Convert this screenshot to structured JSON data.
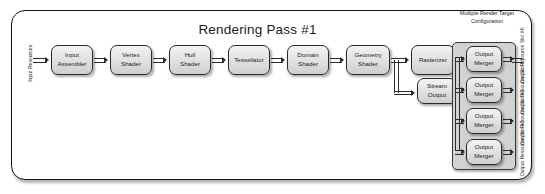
{
  "diagram": {
    "title": "Rendering Pass #1",
    "input_label": "Input\nResources",
    "input_label_line1": "Input",
    "input_label_line2": "Resources",
    "stream_output_resources_line1": "Output",
    "stream_output_resources_line2": "Resources",
    "mrt": {
      "title_line1": "Multiple",
      "title_line2": "Render Target",
      "title_line3": "Configuration"
    }
  },
  "stages": [
    {
      "id": "input-assembler",
      "line1": "Input",
      "line2": "Assembler"
    },
    {
      "id": "vertex-shader",
      "line1": "Vertex",
      "line2": "Shader"
    },
    {
      "id": "hull-shader",
      "line1": "Hull",
      "line2": "Shader"
    },
    {
      "id": "tessellator",
      "line1": "Tessellator",
      "line2": ""
    },
    {
      "id": "domain-shader",
      "line1": "Domain",
      "line2": "Shader"
    },
    {
      "id": "geometry-shader",
      "line1": "Geometry",
      "line2": "Shader"
    },
    {
      "id": "rasterizer",
      "line1": "Rasterizer",
      "line2": ""
    },
    {
      "id": "pixel-shader",
      "line1": "Pixel",
      "line2": "Shader"
    },
    {
      "id": "stream-output",
      "line1": "Stream",
      "line2": "Output"
    }
  ],
  "output_mergers": [
    {
      "line1": "Output",
      "line2": "Merger",
      "slot_line1": "Output",
      "slot_line2": "Resource",
      "slot_line3": "Slot #0"
    },
    {
      "line1": "Output",
      "line2": "Merger",
      "slot_line1": "Output",
      "slot_line2": "Resource",
      "slot_line3": "Slot #1"
    },
    {
      "line1": "Output",
      "line2": "Merger",
      "slot_line1": "Output",
      "slot_line2": "Resource",
      "slot_line3": "Slot #2"
    },
    {
      "line1": "Output",
      "line2": "Merger",
      "slot_line1": "Output",
      "slot_line2": "Resource",
      "slot_line3": "Slot #3"
    }
  ],
  "colors": {
    "frame_border": "#111111",
    "node_border": "#2a2a2a",
    "node_fill": "#e2e2e2",
    "panel_fill": "#d2d2d2",
    "wire": "#2c2c2c",
    "text": "#1d1d1d"
  }
}
